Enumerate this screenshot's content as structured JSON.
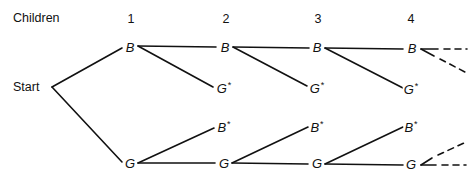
{
  "diagram": {
    "type": "tree",
    "row_label": "Children",
    "start_label": "Start",
    "columns": [
      "1",
      "2",
      "3",
      "4"
    ],
    "nodes": [
      {
        "id": "B1",
        "label": "B",
        "star": "",
        "x": 130,
        "y": 47
      },
      {
        "id": "G1",
        "label": "G",
        "star": "",
        "x": 130,
        "y": 163
      },
      {
        "id": "B2",
        "label": "B",
        "star": "",
        "x": 225,
        "y": 47
      },
      {
        "id": "Gs2",
        "label": "G",
        "star": "*",
        "x": 224,
        "y": 88
      },
      {
        "id": "Bs2",
        "label": "B",
        "star": "*",
        "x": 224,
        "y": 127
      },
      {
        "id": "G2",
        "label": "G",
        "star": "",
        "x": 224,
        "y": 163
      },
      {
        "id": "B3",
        "label": "B",
        "star": "",
        "x": 317,
        "y": 47
      },
      {
        "id": "Gs3",
        "label": "G",
        "star": "*",
        "x": 317,
        "y": 88
      },
      {
        "id": "Bs3",
        "label": "B",
        "star": "*",
        "x": 317,
        "y": 127
      },
      {
        "id": "G3",
        "label": "G",
        "star": "",
        "x": 317,
        "y": 163
      },
      {
        "id": "B4",
        "label": "B",
        "star": "",
        "x": 412,
        "y": 47
      },
      {
        "id": "Gs4",
        "label": "G",
        "star": "*",
        "x": 411,
        "y": 88
      },
      {
        "id": "Bs4",
        "label": "B",
        "star": "*",
        "x": 411,
        "y": 127
      },
      {
        "id": "G4",
        "label": "G",
        "star": "",
        "x": 411,
        "y": 163
      }
    ],
    "edges": [
      [
        "Start",
        "B1"
      ],
      [
        "Start",
        "G1"
      ],
      [
        "B1",
        "B2"
      ],
      [
        "B1",
        "Gs2"
      ],
      [
        "G1",
        "Bs2"
      ],
      [
        "G1",
        "G2"
      ],
      [
        "B2",
        "B3"
      ],
      [
        "B2",
        "Gs3"
      ],
      [
        "G2",
        "Bs3"
      ],
      [
        "G2",
        "G3"
      ],
      [
        "B3",
        "B4"
      ],
      [
        "B3",
        "Gs4"
      ],
      [
        "G3",
        "Bs4"
      ],
      [
        "G3",
        "G4"
      ]
    ],
    "continuation": "dashed lines after generation 4"
  }
}
